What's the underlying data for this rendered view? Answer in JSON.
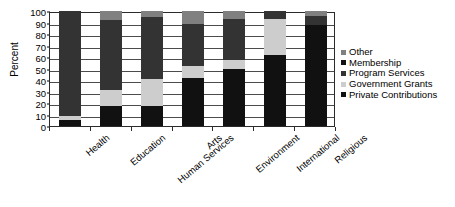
{
  "chart_data": {
    "type": "bar",
    "subtype": "stacked-bar-100",
    "title": "",
    "xlabel": "",
    "ylabel": "Percent",
    "ylim": [
      0,
      100
    ],
    "ytick_step": 10,
    "yticks": [
      100,
      90,
      80,
      70,
      60,
      50,
      40,
      30,
      20,
      10,
      0
    ],
    "grid": true,
    "grid_axis": "y",
    "legend_position": "right",
    "categories": [
      "Health",
      "Education",
      "Human Services",
      "Arts",
      "Environment",
      "International",
      "Religious"
    ],
    "series": [
      {
        "name": "Private Contributions",
        "color": "#111111",
        "values": [
          5,
          17,
          17,
          42,
          50,
          62,
          88
        ]
      },
      {
        "name": "Government Grants",
        "color": "#cdcdcd",
        "values": [
          4,
          14,
          24,
          10,
          7,
          31,
          0
        ]
      },
      {
        "name": "Program Services",
        "color": "#333333",
        "values": [
          91,
          61,
          54,
          37,
          36,
          7,
          8
        ]
      },
      {
        "name": "Membership",
        "color": "#111111",
        "values": [
          0,
          0,
          0,
          0,
          0,
          0,
          0
        ]
      },
      {
        "name": "Other",
        "color": "#808080",
        "values": [
          0,
          8,
          5,
          11,
          7,
          0,
          4
        ]
      }
    ],
    "legend_entries": [
      {
        "label": "Other",
        "color": "#808080"
      },
      {
        "label": "Membership",
        "color": "#111111"
      },
      {
        "label": "Program Services",
        "color": "#333333"
      },
      {
        "label": "Government Grants",
        "color": "#cdcdcd"
      },
      {
        "label": "Private Contributions",
        "color": "#111111"
      }
    ]
  },
  "axis": {
    "y_title": "Percent"
  }
}
